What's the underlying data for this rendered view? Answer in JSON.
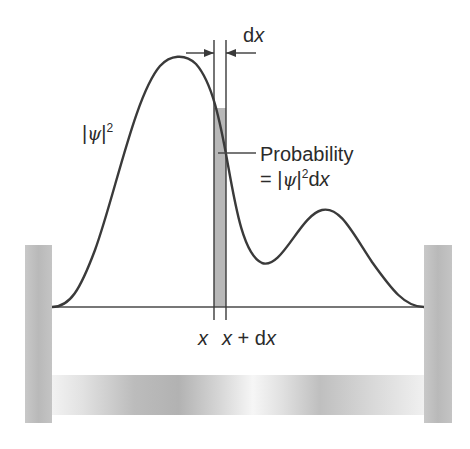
{
  "diagram": {
    "colors": {
      "curve": "#3a3a3a",
      "wall": "#bdbdbd",
      "strip": "#b8b8b8",
      "line": "#4a4a4a",
      "text": "#2b2b2b"
    },
    "labels": {
      "psi_sq_bar_open": "|",
      "psi": "ψ",
      "psi_sq_bar_close": "|",
      "psi_sq_exp": "2",
      "dx_d": "d",
      "dx_x": "x",
      "prob_title": "Probability",
      "prob_eq": "= |",
      "prob_psi": "ψ",
      "prob_bar": "|",
      "prob_exp": "2",
      "prob_d": "d",
      "prob_x": "x",
      "axis_x": "x",
      "axis_x2": "x",
      "axis_plus": " + d",
      "axis_x3": "x"
    },
    "geometry": {
      "left_wall": {
        "x": 25,
        "y": 245,
        "w": 27,
        "h": 178
      },
      "right_wall": {
        "x": 424,
        "y": 245,
        "w": 28,
        "h": 178
      },
      "baseline_y": 307,
      "strip": {
        "x1": 214,
        "x2": 226,
        "top": 108
      },
      "peak1": {
        "x": 178,
        "y": 57
      },
      "valley": {
        "x": 263,
        "y": 263
      },
      "peak2": {
        "x": 325,
        "y": 210
      }
    }
  }
}
